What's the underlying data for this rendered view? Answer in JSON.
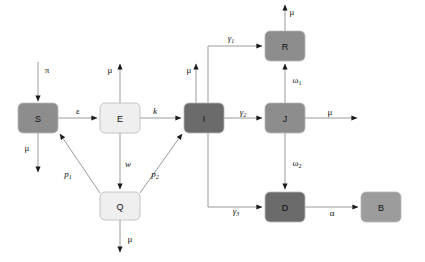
{
  "diagram": {
    "type": "compartmental-flow",
    "nodes": [
      {
        "id": "S",
        "label": "S",
        "x": 18,
        "y": 103,
        "w": 40,
        "h": 30,
        "color": "#8d8d8d"
      },
      {
        "id": "E",
        "label": "E",
        "x": 100,
        "y": 103,
        "w": 40,
        "h": 30,
        "color": "#efefef"
      },
      {
        "id": "Q",
        "label": "Q",
        "x": 100,
        "y": 192,
        "w": 40,
        "h": 28,
        "color": "#efefef"
      },
      {
        "id": "I",
        "label": "I",
        "x": 184,
        "y": 103,
        "w": 40,
        "h": 30,
        "color": "#6b6b6b"
      },
      {
        "id": "R",
        "label": "R",
        "x": 265,
        "y": 31,
        "w": 40,
        "h": 30,
        "color": "#8d8d8d"
      },
      {
        "id": "J",
        "label": "J",
        "x": 265,
        "y": 103,
        "w": 40,
        "h": 30,
        "color": "#8d8d8d"
      },
      {
        "id": "D",
        "label": "D",
        "x": 265,
        "y": 192,
        "w": 40,
        "h": 30,
        "color": "#6b6b6b"
      },
      {
        "id": "B",
        "label": "B",
        "x": 361,
        "y": 192,
        "w": 40,
        "h": 30,
        "color": "#9c9c9c"
      }
    ],
    "rate_labels": [
      {
        "name": "pi-inflow-S",
        "text": "π",
        "sub": "",
        "x": 47,
        "y": 70,
        "italic": false
      },
      {
        "name": "mu-outflow-S",
        "text": "μ",
        "sub": "",
        "x": 27,
        "y": 148,
        "italic": false
      },
      {
        "name": "epsilon-S-to-E",
        "text": "ε",
        "sub": "",
        "x": 78,
        "y": 111,
        "italic": false
      },
      {
        "name": "mu-outflow-E",
        "text": "μ",
        "sub": "",
        "x": 110,
        "y": 70,
        "italic": false
      },
      {
        "name": "k-E-to-I",
        "text": "k",
        "sub": "",
        "x": 155,
        "y": 111,
        "italic": true
      },
      {
        "name": "w-E-to-Q",
        "text": "w",
        "sub": "",
        "x": 128,
        "y": 164,
        "italic": true
      },
      {
        "name": "p1-Q-to-S",
        "text": "p",
        "sub": "1",
        "x": 68,
        "y": 174,
        "italic": true
      },
      {
        "name": "p2-Q-to-I",
        "text": "p",
        "sub": "2",
        "x": 155,
        "y": 174,
        "italic": true
      },
      {
        "name": "mu-outflow-Q",
        "text": "μ",
        "sub": "",
        "x": 130,
        "y": 239,
        "italic": false
      },
      {
        "name": "mu-outflow-I",
        "text": "μ",
        "sub": "",
        "x": 189,
        "y": 70,
        "italic": false
      },
      {
        "name": "gamma1-I-to-R",
        "text": "γ",
        "sub": "1",
        "x": 231,
        "y": 38,
        "italic": true
      },
      {
        "name": "gamma2-I-to-J",
        "text": "γ",
        "sub": "2",
        "x": 243,
        "y": 112,
        "italic": true
      },
      {
        "name": "gamma3-I-to-D",
        "text": "γ",
        "sub": "3",
        "x": 236,
        "y": 211,
        "italic": true
      },
      {
        "name": "mu-outflow-R",
        "text": "μ",
        "sub": "",
        "x": 292,
        "y": 12,
        "italic": false
      },
      {
        "name": "omega1-J-to-R",
        "text": "ω",
        "sub": "1",
        "x": 297,
        "y": 80,
        "italic": false
      },
      {
        "name": "omega2-J-to-D",
        "text": "ω",
        "sub": "2",
        "x": 297,
        "y": 163,
        "italic": false
      },
      {
        "name": "mu-outflow-J",
        "text": "μ",
        "sub": "",
        "x": 330,
        "y": 112,
        "italic": false
      },
      {
        "name": "alpha-D-to-B",
        "text": "α",
        "sub": "",
        "x": 332,
        "y": 213,
        "italic": false
      }
    ]
  }
}
